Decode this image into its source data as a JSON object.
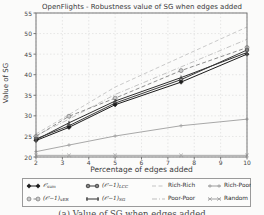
{
  "title": "OpenFlights - Robustness value of SG when edges added",
  "caption": "(a) Value of SG when edges added",
  "chart_data": {
    "type": "line",
    "title": "OpenFlights - Robustness value of SG when edges added",
    "xlabel": "Percentage of edges added",
    "ylabel": "Value of SG",
    "xlim": [
      2,
      10
    ],
    "ylim": [
      20,
      55
    ],
    "x_ticks": [
      2,
      3,
      4,
      5,
      6,
      7,
      8,
      9,
      10
    ],
    "y_ticks": [
      20,
      25,
      30,
      35,
      40,
      45,
      50,
      55
    ],
    "grid": true,
    "legend_position": "below",
    "x": [
      2,
      3.25,
      5,
      7.5,
      10
    ],
    "series": [
      {
        "name": "O_sum",
        "legend_main": "𝒪",
        "legend_sub": "sum",
        "values": [
          24.0,
          27.2,
          32.7,
          38.2,
          45.0
        ],
        "color": "#1c1c1c",
        "marker": "diamond",
        "marker_fill": "#1c1c1c",
        "dash": "solid"
      },
      {
        "name": "(O-1)_LCC",
        "legend_main": "(𝒪−1)",
        "legend_sub": "LCC",
        "values": [
          24.4,
          27.6,
          33.1,
          38.8,
          46.0
        ],
        "color": "#3a3a3a",
        "marker": "asterisk",
        "marker_fill": "#3f3f3f",
        "dash": "solid"
      },
      {
        "name": "(O-1)_vER",
        "legend_main": "(𝒪−1)",
        "legend_sub": "vER",
        "values": [
          25.0,
          29.9,
          34.3,
          41.0,
          46.6
        ],
        "color": "#8f8f8f",
        "marker": "circle",
        "marker_fill": "#c9c9c9",
        "dash": "dashed"
      },
      {
        "name": "(O-1)_SG",
        "legend_main": "(𝒪−1)",
        "legend_sub": "SG",
        "values": [
          24.2,
          28.3,
          33.6,
          39.3,
          45.4
        ],
        "color": "#2e2e2e",
        "marker": "tick",
        "marker_fill": "#2e2e2e",
        "dash": "solid"
      },
      {
        "name": "Rich-Rich",
        "legend_main": "Rich-Rich",
        "legend_sub": "",
        "values": [
          25.6,
          30.3,
          37.0,
          44.3,
          51.6
        ],
        "color": "#c4c4c4",
        "marker": "none",
        "marker_fill": "#c4c4c4",
        "dash": "dashed"
      },
      {
        "name": "Poor-Poor",
        "legend_main": "Poor-Poor",
        "legend_sub": "",
        "values": [
          25.2,
          29.2,
          35.2,
          41.9,
          48.6
        ],
        "color": "#bdbdbd",
        "marker": "none",
        "marker_fill": "#bdbdbd",
        "dash": "dashdot"
      },
      {
        "name": "Rich-Poor",
        "legend_main": "Rich-Poor",
        "legend_sub": "",
        "values": [
          21.3,
          22.9,
          25.1,
          27.6,
          29.2
        ],
        "color": "#9e9e9e",
        "marker": "plus",
        "marker_fill": "#9e9e9e",
        "dash": "solid"
      },
      {
        "name": "Random",
        "legend_main": "Random",
        "legend_sub": "",
        "values": [
          20.4,
          20.4,
          20.4,
          20.4,
          20.4
        ],
        "color": "#a0a0a0",
        "marker": "x",
        "marker_fill": "#a0a0a0",
        "dash": "solid"
      }
    ]
  }
}
